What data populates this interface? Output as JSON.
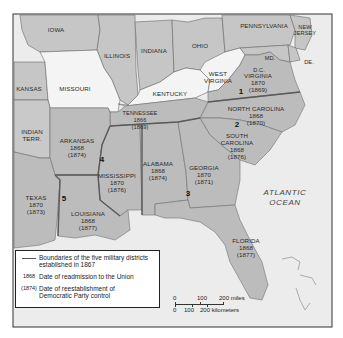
{
  "map": {
    "states": [
      {
        "name": "IOWA"
      },
      {
        "name": "ILLINOIS"
      },
      {
        "name": "INDIANA"
      },
      {
        "name": "OHIO"
      },
      {
        "name": "PENNSYLVANIA"
      },
      {
        "name": "NEW JERSEY",
        "label_line1": "NEW",
        "label_line2": "JERSEY"
      },
      {
        "name": "MD."
      },
      {
        "name": "DE."
      },
      {
        "name": "D.C."
      },
      {
        "name": "KANSAS"
      },
      {
        "name": "MISSOURI"
      },
      {
        "name": "KENTUCKY"
      },
      {
        "name": "WEST VIRGINIA",
        "label_line1": "WEST",
        "label_line2": "VIRGINIA"
      },
      {
        "name": "VIRGINIA",
        "readmission": "1870",
        "democratic_control": "(1869)"
      },
      {
        "name": "NORTH CAROLINA",
        "readmission": "1868",
        "democratic_control": "(1870)"
      },
      {
        "name": "TENNESSEE",
        "readmission": "1866",
        "democratic_control": "(1869)"
      },
      {
        "name": "SOUTH CAROLINA",
        "label_line1": "SOUTH",
        "label_line2": "CAROLINA",
        "readmission": "1868",
        "democratic_control": "(1876)"
      },
      {
        "name": "INDIAN TERR.",
        "label_line1": "INDIAN",
        "label_line2": "TERR."
      },
      {
        "name": "ARKANSAS",
        "readmission": "1868",
        "democratic_control": "(1874)"
      },
      {
        "name": "MISSISSIPPI",
        "readmission": "1870",
        "democratic_control": "(1876)"
      },
      {
        "name": "ALABAMA",
        "readmission": "1868",
        "democratic_control": "(1874)"
      },
      {
        "name": "GEORGIA",
        "readmission": "1870",
        "democratic_control": "(1871)"
      },
      {
        "name": "TEXAS",
        "readmission": "1870",
        "democratic_control": "(1873)"
      },
      {
        "name": "LOUISIANA",
        "readmission": "1868",
        "democratic_control": "(1877)"
      },
      {
        "name": "FLORIDA",
        "readmission": "1868",
        "democratic_control": "(1877)"
      }
    ],
    "military_districts": [
      "1",
      "2",
      "3",
      "4",
      "5"
    ],
    "ocean_label_line1": "ATLANTIC",
    "ocean_label_line2": "OCEAN",
    "colors": {
      "confederate_states": "#bdbdbd",
      "border_states": "#f4f4f4",
      "union_states": "#c9c9c9",
      "ocean": "#ececec",
      "district_boundary": "#6e6e6e"
    }
  },
  "legend": {
    "items": [
      {
        "key": "line",
        "text": "Boundaries of the five military districts established in 1867"
      },
      {
        "key": "1868",
        "text": "Date of readmission to the Union"
      },
      {
        "key": "(1874)",
        "text": "Date of reestablishment of Democratic Party control"
      }
    ]
  },
  "scale_bar": {
    "miles": [
      "0",
      "100",
      "200 miles"
    ],
    "kilometers": [
      "0",
      "100",
      "200 kilometers"
    ]
  }
}
